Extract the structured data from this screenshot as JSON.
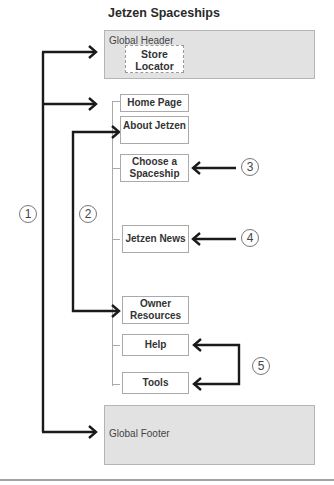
{
  "title": "Jetzen Spaceships",
  "header": {
    "label": "Global Header",
    "store_locator": "Store Locator"
  },
  "nav": [
    {
      "id": "home",
      "label": "Home Page"
    },
    {
      "id": "about",
      "label": "About Jetzen"
    },
    {
      "id": "choose",
      "label": "Choose a Spaceship"
    },
    {
      "id": "news",
      "label": "Jetzen News"
    },
    {
      "id": "owner",
      "label": "Owner Resources"
    },
    {
      "id": "help",
      "label": "Help"
    },
    {
      "id": "tools",
      "label": "Tools"
    }
  ],
  "footer": {
    "label": "Global Footer"
  },
  "callouts": [
    "1",
    "2",
    "3",
    "4",
    "5"
  ],
  "colors": {
    "box_fill": "#e2e2e2",
    "arrow": "#1a1a1a",
    "tree_line": "#aaaaaa"
  }
}
